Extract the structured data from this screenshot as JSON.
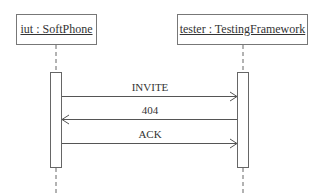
{
  "diagram": {
    "type": "sequence",
    "participants": [
      {
        "id": "iut",
        "label": "iut : SoftPhone"
      },
      {
        "id": "tester",
        "label": "tester : TestingFramework"
      }
    ],
    "messages": [
      {
        "from": "iut",
        "to": "tester",
        "label": "INVITE"
      },
      {
        "from": "tester",
        "to": "iut",
        "label": "404"
      },
      {
        "from": "iut",
        "to": "tester",
        "label": "ACK"
      }
    ],
    "colors": {
      "line": "#555555",
      "box_border": "#777777",
      "text": "#333333"
    }
  }
}
